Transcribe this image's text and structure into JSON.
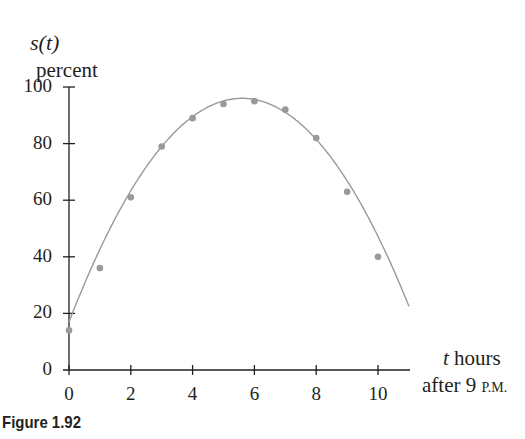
{
  "chart_data": {
    "type": "scatter",
    "title": "",
    "figure_label": "Figure 1.92",
    "ylabel": {
      "func": "s(t)",
      "units": "percent"
    },
    "xlabel": {
      "var": "t",
      "line1_rest": " hours",
      "line2_prefix": "after 9 ",
      "line2_suffix": "P.M."
    },
    "xlim": [
      0,
      11.2
    ],
    "ylim": [
      0,
      100
    ],
    "xticks": [
      0,
      2,
      4,
      6,
      8,
      10
    ],
    "yticks": [
      0,
      20,
      40,
      60,
      80,
      100
    ],
    "grid": false,
    "legend": null,
    "series": [
      {
        "name": "observed",
        "kind": "points",
        "color": "#999999",
        "x": [
          0,
          1,
          2,
          3,
          4,
          5,
          6,
          7,
          8,
          9,
          10
        ],
        "y": [
          14,
          36,
          61,
          79,
          89,
          94,
          95,
          92,
          82,
          63,
          40
        ]
      },
      {
        "name": "fitted curve",
        "kind": "line",
        "color": "#999999",
        "model": "quadratic",
        "vertex": [
          5.6,
          96
        ],
        "coefficient": -2.52
      }
    ]
  },
  "labels": {
    "ylabel_func": "s(t)",
    "ylabel_units": "percent",
    "x_t": "t",
    "x_hours": " hours",
    "x_after": "after 9 ",
    "x_pm": "P.M.",
    "figure": "Figure 1.92",
    "yticks": [
      "0",
      "20",
      "40",
      "60",
      "80",
      "100"
    ],
    "xticks": [
      "0",
      "2",
      "4",
      "6",
      "8",
      "10"
    ]
  }
}
